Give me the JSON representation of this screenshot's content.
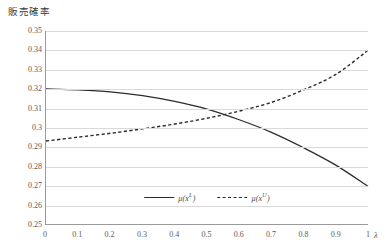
{
  "chart_data": {
    "type": "line",
    "title": "販売確率",
    "xlabel": "λ",
    "ylabel": "",
    "xlim": [
      0,
      1
    ],
    "ylim": [
      0.25,
      0.35
    ],
    "grid": "horizontal",
    "legend_position": "bottom-center-inside",
    "x_ticks": [
      "0",
      "0.1",
      "0.2",
      "0.3",
      "0.4",
      "0.5",
      "0.6",
      "0.7",
      "0.8",
      "0.9",
      "1"
    ],
    "y_ticks": [
      "0.35",
      "0.34",
      "0.33",
      "0.32",
      "0.31",
      "0.3",
      "0.29",
      "0.28",
      "0.27",
      "0.26",
      "0.25"
    ],
    "x": [
      0,
      0.1,
      0.2,
      0.3,
      0.4,
      0.5,
      0.6,
      0.7,
      0.8,
      0.9,
      1
    ],
    "series": [
      {
        "name": "mu(x^L)",
        "label_base": "μ(x",
        "label_sup": "L",
        "style": "solid",
        "color": "#2b2b2b",
        "values": [
          0.32,
          0.3195,
          0.3185,
          0.3165,
          0.3135,
          0.3095,
          0.304,
          0.2975,
          0.2895,
          0.2805,
          0.2695
        ]
      },
      {
        "name": "mu(x^U)",
        "label_base": "μ(x",
        "label_sup": "U",
        "style": "dashed",
        "color": "#2b2b2b",
        "values": [
          0.293,
          0.295,
          0.297,
          0.2993,
          0.3018,
          0.3048,
          0.3085,
          0.313,
          0.3195,
          0.3275,
          0.34
        ]
      }
    ],
    "annotations": {
      "crossing_lambda": 0.55,
      "crossing_value": 0.3055
    }
  },
  "legend": {
    "entries": [
      {
        "text_base": "μ(x",
        "text_sup": "L",
        "text_close": ")"
      },
      {
        "text_base": "μ(x",
        "text_sup": "U",
        "text_close": ")"
      }
    ]
  }
}
